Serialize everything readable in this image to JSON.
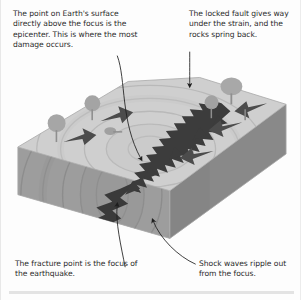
{
  "figure": {
    "type": "labeled-3d-block-diagram",
    "background_color": "#fdfdfd",
    "text_color": "#2b2b2b",
    "annotations": [
      {
        "id": "epicenter",
        "position": "top-left",
        "text": "The point on Earth's surface directly above the focus is the epicenter. This is where the most damage occurs.",
        "leader": "curved-line-with-arrowhead-pointing-down-to-surface"
      },
      {
        "id": "locked-fault",
        "position": "top-right",
        "text": "The locked fault gives way under the strain, and the rocks spring back.",
        "leader": "curved-line-with-arrowhead-pointing-down-left-to-fault"
      },
      {
        "id": "focus",
        "position": "bottom-left",
        "text": "The fracture point is the focus of the earthquake.",
        "leader": "curved-line-with-arrowhead-pointing-up-to-fracture-point"
      },
      {
        "id": "shock-waves",
        "position": "bottom-right",
        "text": "Shock waves ripple out from the focus.",
        "leader": "curved-line-with-arrowhead-pointing-up-to-wave-rings"
      }
    ],
    "block": {
      "top_face_color": "#cfcfcf",
      "front_face_color": "#9d9d9d",
      "right_face_color": "#8a8a8a",
      "shock_wave_color": "#b4b4b4",
      "fault_color": "#3a3a3a",
      "arrow_color": "#4a4a4a",
      "tree_color": "#9a9a9a",
      "shock_wave_rings": 5
    }
  }
}
